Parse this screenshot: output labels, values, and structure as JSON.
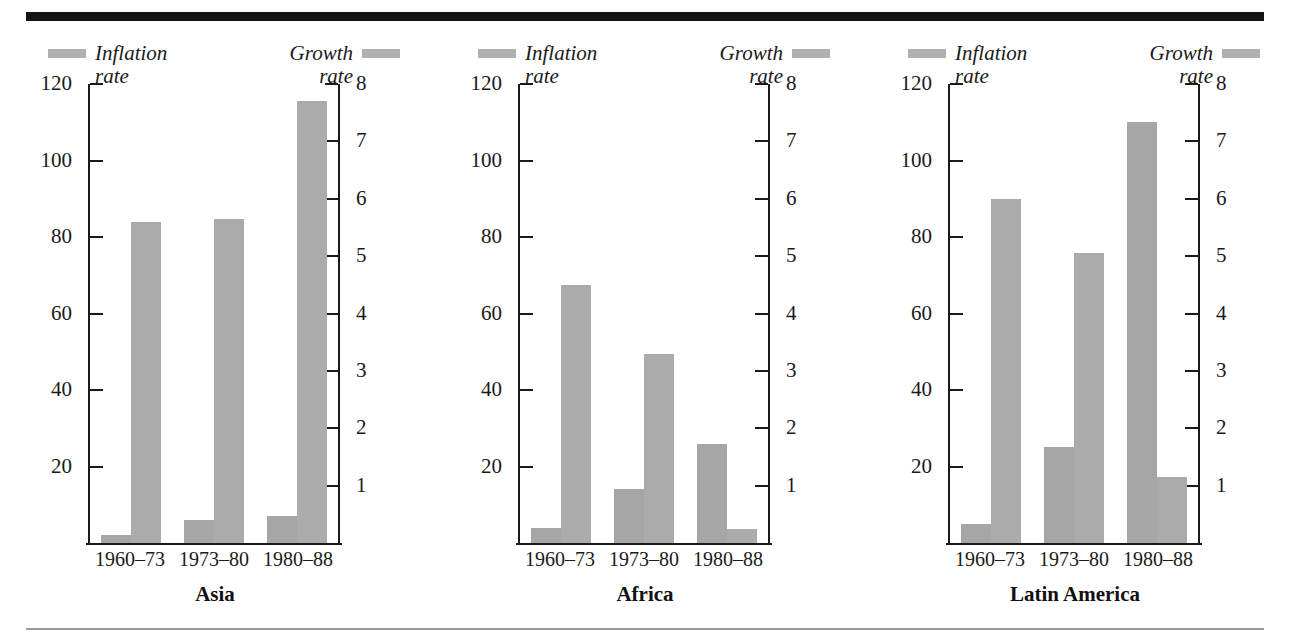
{
  "legend": {
    "inflation_label": "Inflation\nrate",
    "growth_label": "Growth\nrate",
    "swatch_color": "#b0b0b0"
  },
  "axes": {
    "left_ticks": [
      "20",
      "40",
      "60",
      "80",
      "100",
      "120"
    ],
    "right_ticks": [
      "1",
      "2",
      "3",
      "4",
      "5",
      "6",
      "7",
      "8"
    ],
    "left_label": "Inflation rate",
    "right_label": "Growth rate"
  },
  "chart_data": {
    "type": "bar",
    "title": "",
    "categories": [
      "1960–73",
      "1973–80",
      "1980–88"
    ],
    "xlabel": "",
    "ylabel": "Inflation rate",
    "y2label": "Growth rate",
    "ylim": [
      0,
      120
    ],
    "y2lim": [
      0,
      8
    ],
    "yticks": [
      0,
      20,
      40,
      60,
      80,
      100,
      120
    ],
    "y2ticks": [
      0,
      1,
      2,
      3,
      4,
      5,
      6,
      7,
      8
    ],
    "grid": false,
    "legend": [
      "Inflation rate",
      "Growth rate"
    ],
    "legend_position": "top",
    "panels": [
      {
        "name": "Asia",
        "series": [
          {
            "name": "Inflation rate",
            "axis": "left",
            "values": [
              2,
              6,
              7
            ]
          },
          {
            "name": "Growth rate",
            "axis": "right",
            "values": [
              5.6,
              5.65,
              7.7
            ]
          }
        ]
      },
      {
        "name": "Africa",
        "series": [
          {
            "name": "Inflation rate",
            "axis": "left",
            "values": [
              4,
              14,
              26
            ]
          },
          {
            "name": "Growth rate",
            "axis": "right",
            "values": [
              4.5,
              3.3,
              0.25
            ]
          }
        ]
      },
      {
        "name": "Latin America",
        "series": [
          {
            "name": "Inflation rate",
            "axis": "left",
            "values": [
              5,
              25,
              110
            ]
          },
          {
            "name": "Growth rate",
            "axis": "right",
            "values": [
              6.0,
              5.05,
              1.15
            ]
          }
        ]
      }
    ]
  },
  "panels": [
    {
      "title": "Asia"
    },
    {
      "title": "Africa"
    },
    {
      "title": "Latin America"
    }
  ]
}
